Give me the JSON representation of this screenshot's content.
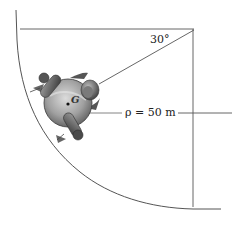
{
  "figure": {
    "type": "mechanics-diagram",
    "labels": {
      "angle": "30°",
      "radius": "ρ = 50 m",
      "center_of_mass": "G"
    },
    "colors": {
      "lines": "#555555",
      "body_light": "#c8c8c8",
      "body_dark": "#5a5a5a",
      "background": "#ffffff"
    }
  }
}
